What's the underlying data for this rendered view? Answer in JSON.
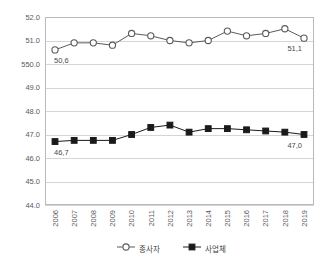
{
  "top_strip": {
    "left_fragment": "",
    "right_fragment": ""
  },
  "chart_data": {
    "type": "line",
    "title": "",
    "subtitle": "",
    "xlabel": "",
    "ylabel": "",
    "ylim": [
      44.0,
      52.0
    ],
    "ytick_step": 1.0,
    "grid": true,
    "grid_axis": "y",
    "legend_position": "bottom",
    "decimal_separator": ",",
    "categories": [
      "2006",
      "2007",
      "2008",
      "2009",
      "2010",
      "2011",
      "2012",
      "2013",
      "2014",
      "2015",
      "2016",
      "2017",
      "2018",
      "2019"
    ],
    "ytick_labels": [
      "52.0",
      "51.0",
      "550.0",
      "49.0",
      "48.0",
      "47.0",
      "46.0",
      "45.0",
      "44.0"
    ],
    "ytick_values": [
      52.0,
      51.0,
      50.0,
      49.0,
      48.0,
      47.0,
      46.0,
      45.0,
      44.0
    ],
    "series": [
      {
        "name": "종사자",
        "marker": "open-circle",
        "color": "#5a5a5a",
        "values": [
          50.6,
          50.9,
          50.9,
          50.8,
          51.3,
          51.2,
          51.0,
          50.9,
          51.0,
          51.4,
          51.2,
          51.3,
          51.5,
          51.1
        ],
        "point_labels": {
          "0": "50,6",
          "13": "51,1"
        }
      },
      {
        "name": "사업체",
        "marker": "filled-square",
        "color": "#1a1a1a",
        "values": [
          46.7,
          46.75,
          46.75,
          46.75,
          47.0,
          47.3,
          47.4,
          47.1,
          47.25,
          47.25,
          47.2,
          47.15,
          47.1,
          47.0
        ],
        "point_labels": {
          "0": "46,7",
          "13": "47,0"
        }
      }
    ],
    "legend": [
      {
        "label": "종사자",
        "marker": "open-circle"
      },
      {
        "label": "사업체",
        "marker": "filled-square"
      }
    ]
  }
}
